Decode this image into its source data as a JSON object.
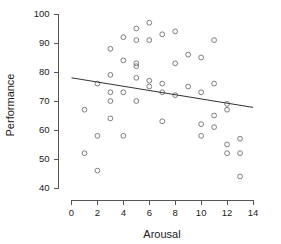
{
  "chart_data": {
    "type": "scatter",
    "title": "",
    "xlabel": "Arousal",
    "ylabel": "Performance",
    "xlim": [
      0,
      14
    ],
    "ylim": [
      40,
      100
    ],
    "xticks": [
      0,
      2,
      4,
      6,
      8,
      10,
      12,
      14
    ],
    "yticks": [
      40,
      50,
      60,
      70,
      80,
      90,
      100
    ],
    "xtick_labels": [
      "0",
      "2",
      "4",
      "6",
      "8",
      "10",
      "12",
      "14"
    ],
    "ytick_labels": [
      "40",
      "50",
      "60",
      "70",
      "80",
      "90",
      "100"
    ],
    "grid": false,
    "legend": null,
    "marker": "open-circle",
    "marker_color": "#6f6f6f",
    "trend_line": {
      "label": "linear fit",
      "color": "#333333",
      "x_start": 0.0,
      "y_start": 78.0,
      "x_end": 14.0,
      "y_end": 67.8
    },
    "points": [
      {
        "x": 1,
        "y": 67
      },
      {
        "x": 1,
        "y": 52
      },
      {
        "x": 2,
        "y": 76
      },
      {
        "x": 2,
        "y": 58
      },
      {
        "x": 2,
        "y": 46
      },
      {
        "x": 3,
        "y": 88
      },
      {
        "x": 3,
        "y": 79
      },
      {
        "x": 3,
        "y": 73
      },
      {
        "x": 3,
        "y": 70
      },
      {
        "x": 3,
        "y": 64
      },
      {
        "x": 4,
        "y": 92
      },
      {
        "x": 4,
        "y": 84
      },
      {
        "x": 4,
        "y": 73
      },
      {
        "x": 4,
        "y": 58
      },
      {
        "x": 5,
        "y": 95
      },
      {
        "x": 5,
        "y": 91
      },
      {
        "x": 5,
        "y": 83
      },
      {
        "x": 5,
        "y": 82
      },
      {
        "x": 5,
        "y": 78
      },
      {
        "x": 5,
        "y": 70
      },
      {
        "x": 6,
        "y": 97
      },
      {
        "x": 6,
        "y": 91
      },
      {
        "x": 6,
        "y": 77
      },
      {
        "x": 6,
        "y": 75
      },
      {
        "x": 7,
        "y": 93
      },
      {
        "x": 7,
        "y": 76
      },
      {
        "x": 7,
        "y": 73
      },
      {
        "x": 7,
        "y": 63
      },
      {
        "x": 8,
        "y": 94
      },
      {
        "x": 8,
        "y": 83
      },
      {
        "x": 8,
        "y": 72
      },
      {
        "x": 9,
        "y": 86
      },
      {
        "x": 9,
        "y": 75
      },
      {
        "x": 10,
        "y": 85
      },
      {
        "x": 10,
        "y": 73
      },
      {
        "x": 10,
        "y": 62
      },
      {
        "x": 10,
        "y": 58
      },
      {
        "x": 11,
        "y": 91
      },
      {
        "x": 11,
        "y": 76
      },
      {
        "x": 11,
        "y": 65
      },
      {
        "x": 11,
        "y": 61
      },
      {
        "x": 12,
        "y": 69
      },
      {
        "x": 12,
        "y": 67
      },
      {
        "x": 12,
        "y": 55
      },
      {
        "x": 12,
        "y": 52
      },
      {
        "x": 13,
        "y": 57
      },
      {
        "x": 13,
        "y": 52
      },
      {
        "x": 13,
        "y": 44
      }
    ]
  },
  "axes": {
    "x_axis_name": "arousal-axis",
    "y_axis_name": "performance-axis"
  }
}
